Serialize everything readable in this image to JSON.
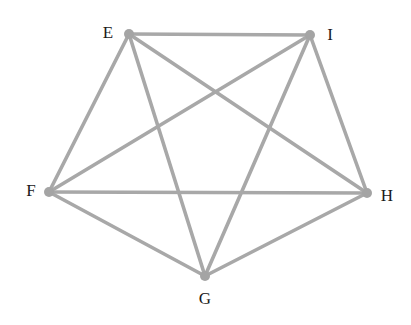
{
  "diagram": {
    "type": "complete-graph",
    "nodes": [
      {
        "id": "E",
        "label": "E",
        "x": 129,
        "y": 34,
        "label_x": 108,
        "label_y": 38
      },
      {
        "id": "I",
        "label": "I",
        "x": 310,
        "y": 35,
        "label_x": 330,
        "label_y": 40
      },
      {
        "id": "F",
        "label": "F",
        "x": 49,
        "y": 192,
        "label_x": 31,
        "label_y": 196
      },
      {
        "id": "H",
        "label": "H",
        "x": 367,
        "y": 193,
        "label_x": 387,
        "label_y": 201
      },
      {
        "id": "G",
        "label": "G",
        "x": 205,
        "y": 276,
        "label_x": 205,
        "label_y": 304
      }
    ],
    "edges": [
      [
        "E",
        "I"
      ],
      [
        "E",
        "F"
      ],
      [
        "E",
        "G"
      ],
      [
        "E",
        "H"
      ],
      [
        "I",
        "F"
      ],
      [
        "I",
        "G"
      ],
      [
        "I",
        "H"
      ],
      [
        "F",
        "G"
      ],
      [
        "F",
        "H"
      ],
      [
        "G",
        "H"
      ]
    ],
    "colors": {
      "edge": "#a8a8a8",
      "node": "#a4a4a4",
      "label": "#1a1a1a"
    }
  }
}
